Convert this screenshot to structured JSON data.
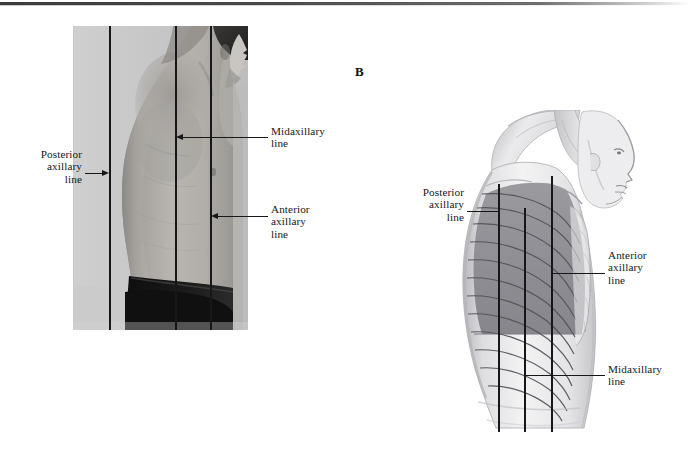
{
  "figure": {
    "panel_a": {
      "name": "photograph-lateral-thorax",
      "letter": "",
      "caption": "",
      "lines": [
        {
          "id": "posterior-axillary",
          "label_line1": "Posterior",
          "label_line2": "axillary",
          "label_line3": "line"
        },
        {
          "id": "midaxillary",
          "label_line1": "Midaxillary",
          "label_line2": "line",
          "label_line3": ""
        },
        {
          "id": "anterior-axillary",
          "label_line1": "Anterior",
          "label_line2": "axillary",
          "label_line3": "line"
        }
      ]
    },
    "panel_b": {
      "name": "illustration-lateral-thorax-ribcage",
      "letter": "B",
      "lines": [
        {
          "id": "posterior-axillary",
          "label_line1": "Posterior",
          "label_line2": "axillary",
          "label_line3": "line"
        },
        {
          "id": "anterior-axillary",
          "label_line1": "Anterior",
          "label_line2": "axillary",
          "label_line3": "line"
        },
        {
          "id": "midaxillary",
          "label_line1": "Midaxillary",
          "label_line2": "line",
          "label_line3": ""
        }
      ]
    }
  },
  "labels": {
    "posterior_axillary_1": "Posterior",
    "posterior_axillary_2": "axillary",
    "posterior_axillary_3": "line",
    "midaxillary_1": "Midaxillary",
    "midaxillary_2": "line",
    "anterior_axillary_1": "Anterior",
    "anterior_axillary_2": "axillary",
    "anterior_axillary_3": "line",
    "panel_b_letter": "B"
  },
  "colors": {
    "ink": "#17171a",
    "page_background": "#ffffff",
    "photo_backdrop": "#c4c4c4",
    "skin_mid": "#a9a9a9",
    "shorts_dark": "#141414",
    "lung_shade": "#8e8e92",
    "rib_line": "#5a5a5e"
  }
}
